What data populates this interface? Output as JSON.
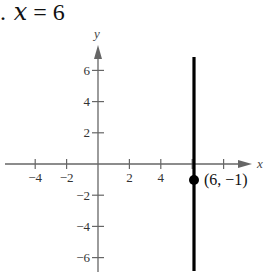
{
  "problem": {
    "number_fragment": ".",
    "equation_var": "x",
    "equation_rest": " = 6"
  },
  "chart_data": {
    "type": "line",
    "title": "x = 6",
    "xlabel": "x",
    "ylabel": "y",
    "x_ticks": [
      -4,
      -2,
      2,
      4
    ],
    "y_ticks": [
      6,
      4,
      2,
      -2,
      -4,
      -6
    ],
    "x_tick_labels": [
      "−4",
      "−2",
      "2",
      "4"
    ],
    "y_tick_labels": [
      "6",
      "4",
      "2",
      "−2",
      "−4",
      "−6"
    ],
    "xlim": [
      -5,
      9
    ],
    "ylim": [
      -7,
      7
    ],
    "grid": false,
    "series": [
      {
        "name": "x = 6",
        "x": [
          6,
          6
        ],
        "y": [
          -7,
          7
        ],
        "color": "#000000"
      }
    ],
    "annotations": [
      {
        "x": 6,
        "y": -1,
        "label": "(6, −1)"
      }
    ]
  },
  "colors": {
    "axis": "#666666",
    "line": "#000000"
  }
}
